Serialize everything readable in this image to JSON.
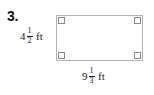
{
  "problem": {
    "number": "3."
  },
  "figure": {
    "shape_name": "rectangle",
    "border_color": "#b4b4b4",
    "right_angle_mark_color": "#8a8a8a",
    "background_color": "#ffffff",
    "right_angle_marks": 4
  },
  "labels": {
    "height": {
      "whole": "4",
      "numerator": "1",
      "denominator": "2",
      "unit": "ft",
      "full_text": "4 1/2 ft"
    },
    "width": {
      "whole": "9",
      "numerator": "1",
      "denominator": "3",
      "unit": "ft",
      "full_text": "9 1/3 ft"
    }
  }
}
